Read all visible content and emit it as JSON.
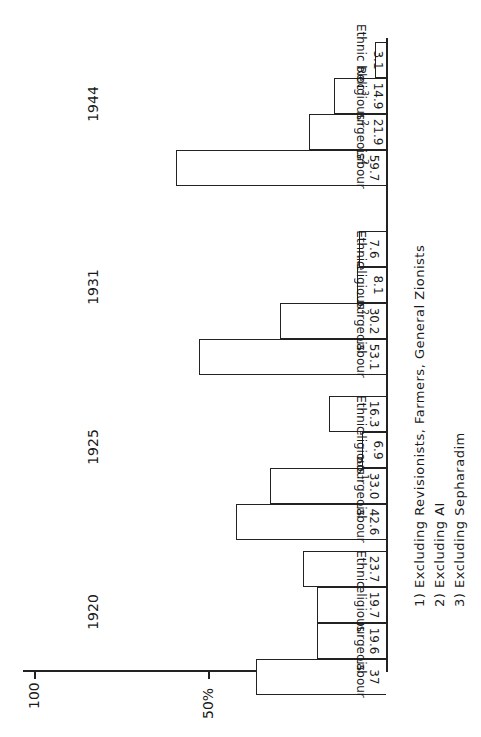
{
  "chart_data": {
    "type": "bar",
    "title": "",
    "xlabel": "",
    "ylabel": "%",
    "ylim": [
      0,
      100
    ],
    "yticks": [
      {
        "value": 50,
        "label": "50%"
      },
      {
        "value": 100,
        "label": "100"
      }
    ],
    "orientation_note": "figure rotated 90 degrees in scan",
    "categories": [
      "1920",
      "1925",
      "1931",
      "1944"
    ],
    "groups": [
      {
        "year": "1920",
        "bars": [
          {
            "name": "Labour",
            "value": 37,
            "label": "37"
          },
          {
            "name": "Bourgeois",
            "value": 19.6,
            "label": "19.6"
          },
          {
            "name": "Religious",
            "value": 19.7,
            "label": "19.7"
          },
          {
            "name": "Ethnic",
            "value": 23.7,
            "label": "23.7"
          }
        ]
      },
      {
        "year": "1925",
        "bars": [
          {
            "name": "Labour",
            "value": 42.6,
            "label": "42.6"
          },
          {
            "name": "Bourgeois",
            "value": 33.0,
            "label": "33.0"
          },
          {
            "name": "Religious",
            "value": 6.9,
            "label": "6.9",
            "footnote": "1"
          },
          {
            "name": "Ethnic",
            "value": 16.3,
            "label": "16.3"
          }
        ]
      },
      {
        "year": "1931",
        "bars": [
          {
            "name": "Labour",
            "value": 53.1,
            "label": "53.1"
          },
          {
            "name": "Bourgeois",
            "value": 30.2,
            "label": "30.2"
          },
          {
            "name": "Religious",
            "value": 8.1,
            "label": "8.1",
            "footnote": "2"
          },
          {
            "name": "Ethnic",
            "value": 7.6,
            "label": "7.6"
          }
        ]
      },
      {
        "year": "1944",
        "bars": [
          {
            "name": "Labour",
            "value": 59.7,
            "label": "59.7"
          },
          {
            "name": "Bourgeois",
            "value": 21.9,
            "label": "21.9",
            "footnote": "2"
          },
          {
            "name": "Religious",
            "value": 14.9,
            "label": "14.9",
            "footnote": "2"
          },
          {
            "name": "Ethnic bloc",
            "value": 3.1,
            "label": "3.1",
            "footnote": "3"
          }
        ]
      }
    ],
    "footnotes": [
      "1) Excluding Revisionists, Farmers, General Zionists",
      "2) Excluding AI",
      "3) Excluding Sepharadim"
    ]
  },
  "axis": {
    "tick_100": "100",
    "tick_50": "50%"
  },
  "years": [
    "1920",
    "1925",
    "1931",
    "1944"
  ],
  "footnotes": [
    "1) Excluding Revisionists, Farmers, General Zionists",
    "2) Excluding AI",
    "3) Excluding Sepharadim"
  ]
}
